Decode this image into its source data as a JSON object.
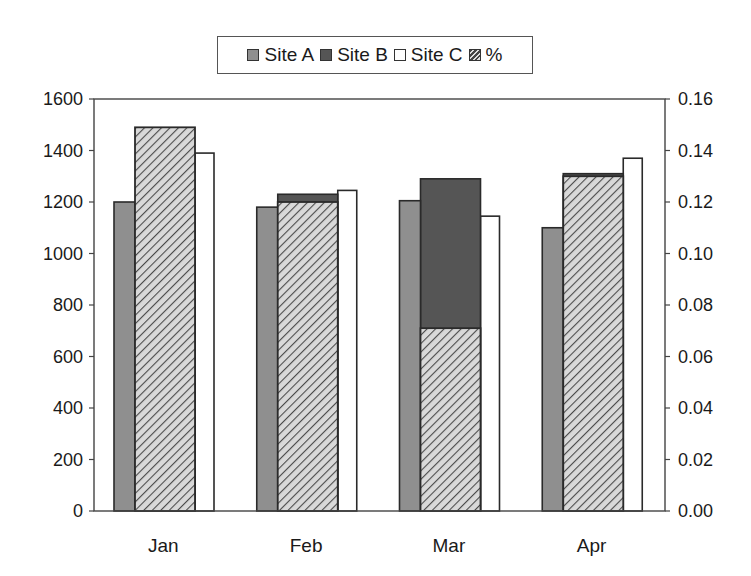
{
  "chart_data": {
    "type": "bar",
    "title": "",
    "categories": [
      "Jan",
      "Feb",
      "Mar",
      "Apr"
    ],
    "series": [
      {
        "name": "Site A",
        "axis": "left",
        "color": "#8f8f8f",
        "pattern": "solid",
        "values": [
          1200,
          1180,
          1205,
          1100
        ]
      },
      {
        "name": "Site B",
        "axis": "left",
        "color": "#555555",
        "pattern": "solid",
        "values": [
          1200,
          1230,
          1290,
          1310
        ]
      },
      {
        "name": "Site C",
        "axis": "left",
        "color": "#ffffff",
        "pattern": "solid",
        "values": [
          1390,
          1245,
          1145,
          1370
        ]
      },
      {
        "name": "%",
        "axis": "right",
        "color": "#b5b5b5",
        "pattern": "diagonal-hatch",
        "values": [
          0.149,
          0.12,
          0.071,
          0.13
        ]
      }
    ],
    "y_left": {
      "label": "",
      "ylim": [
        0,
        1600
      ],
      "ticks": [
        "0",
        "200",
        "400",
        "600",
        "800",
        "1000",
        "1200",
        "1400",
        "1600"
      ]
    },
    "y_right": {
      "label": "",
      "ylim": [
        0,
        0.16
      ],
      "ticks": [
        "0.00",
        "0.02",
        "0.04",
        "0.06",
        "0.08",
        "0.10",
        "0.12",
        "0.14",
        "0.16"
      ]
    },
    "xlabel": "",
    "grid": false,
    "legend": {
      "position": "top",
      "entries": [
        "Site A",
        "Site B",
        "Site C",
        "%"
      ]
    }
  }
}
